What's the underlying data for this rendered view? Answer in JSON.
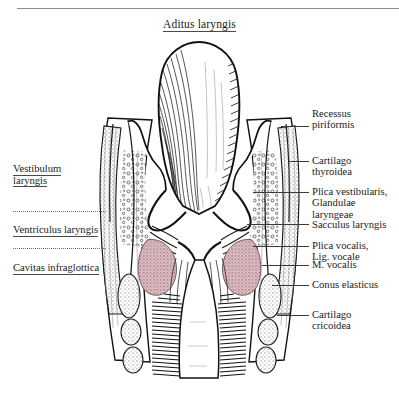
{
  "figure": {
    "title": "Aditus laryngis",
    "kind": "anatomical-illustration",
    "colors": {
      "ink": "#1a1a1a",
      "rule": "#8d8d8d",
      "cartilage_stipple": "#9a9a9a",
      "vocalis_muscle": "#b98e95",
      "background": "#ffffff"
    }
  },
  "left_labels": [
    {
      "id": "vestibulum-laryngis",
      "line1": "Vestibulum",
      "line2": "laryngis"
    },
    {
      "id": "ventriculus-laryngis",
      "line1": "Ventriculus laryngis",
      "line2": ""
    },
    {
      "id": "cavitas-infraglottica",
      "line1": "Cavitas infraglottica",
      "line2": ""
    }
  ],
  "right_labels": [
    {
      "id": "recessus-piriformis",
      "line1": "Recessus",
      "line2": "piriformis",
      "line3": ""
    },
    {
      "id": "cartilago-thyroidea",
      "line1": "Cartilago",
      "line2": "thyroidea",
      "line3": ""
    },
    {
      "id": "plica-vestibularis",
      "line1": "Plica vestibularis,",
      "line2": "Glandulae",
      "line3": "laryngeae"
    },
    {
      "id": "sacculus-laryngis",
      "line1": "Sacculus laryngis",
      "line2": "",
      "line3": ""
    },
    {
      "id": "plica-vocalis",
      "line1": "Plica vocalis,",
      "line2": "Lig. vocale",
      "line3": ""
    },
    {
      "id": "m-vocalis",
      "line1": "M. vocalis",
      "line2": "",
      "line3": ""
    },
    {
      "id": "conus-elasticus",
      "line1": "Conus elasticus",
      "line2": "",
      "line3": ""
    },
    {
      "id": "cartilago-cricoidea",
      "line1": "Cartilago",
      "line2": "cricoidea",
      "line3": ""
    }
  ]
}
